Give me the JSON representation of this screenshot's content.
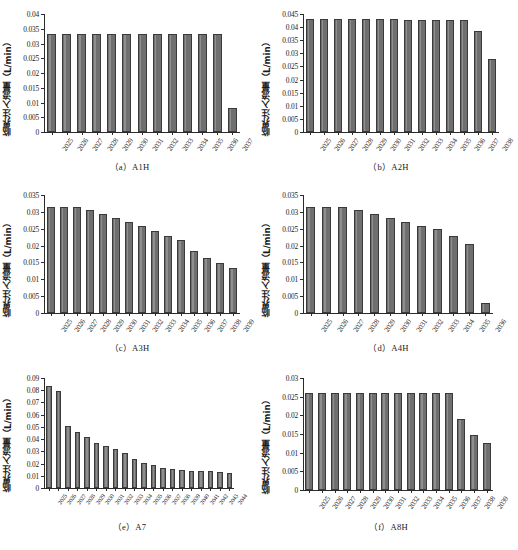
{
  "figure": {
    "y_axis_label": "临界注入流量（L/min）",
    "units": "L/min"
  },
  "chart_data": [
    {
      "type": "bar",
      "panel": "a",
      "title": "（a）A1H",
      "xlabel": "",
      "ylabel": "临界注入流量（L/min）",
      "ylim": [
        0,
        0.04
      ],
      "yticks": [
        0,
        0.005,
        0.01,
        0.015,
        0.02,
        0.025,
        0.03,
        0.035,
        0.04
      ],
      "ytick_labels": [
        "0",
        "0.005",
        "0.01",
        "0.015",
        "0.02",
        "0.025",
        "0.03",
        "0.035",
        "0.04"
      ],
      "grid": false,
      "legend": "none",
      "categories": [
        "2025",
        "2026",
        "2027",
        "2028",
        "2029",
        "2030",
        "2031",
        "2032",
        "2033",
        "2034",
        "2035",
        "2036",
        "2037"
      ],
      "values": [
        0.0332,
        0.0332,
        0.0332,
        0.0332,
        0.0332,
        0.0332,
        0.0332,
        0.0332,
        0.0332,
        0.0332,
        0.0332,
        0.0331,
        0.008
      ]
    },
    {
      "type": "bar",
      "panel": "b",
      "title": "（b）A2H",
      "xlabel": "",
      "ylabel": "临界注入流量（L/min）",
      "ylim": [
        0,
        0.045
      ],
      "yticks": [
        0,
        0.005,
        0.01,
        0.015,
        0.02,
        0.025,
        0.03,
        0.035,
        0.04,
        0.045
      ],
      "ytick_labels": [
        "0",
        "0.005",
        "0.01",
        "0.015",
        "0.02",
        "0.025",
        "0.03",
        "0.035",
        "0.04",
        "0.045"
      ],
      "grid": false,
      "legend": "none",
      "categories": [
        "2025",
        "2026",
        "2027",
        "2028",
        "2029",
        "2030",
        "2031",
        "2032",
        "2033",
        "2034",
        "2035",
        "2036",
        "2037",
        "2038"
      ],
      "values": [
        0.043,
        0.043,
        0.043,
        0.043,
        0.043,
        0.043,
        0.043,
        0.0429,
        0.0429,
        0.0429,
        0.0429,
        0.0428,
        0.0385,
        0.0278
      ]
    },
    {
      "type": "bar",
      "panel": "c",
      "title": "（c）A3H",
      "xlabel": "",
      "ylabel": "临界注入流量（L/min）",
      "ylim": [
        0,
        0.035
      ],
      "yticks": [
        0,
        0.005,
        0.01,
        0.015,
        0.02,
        0.025,
        0.03,
        0.035
      ],
      "ytick_labels": [
        "0",
        "0.005",
        "0.01",
        "0.015",
        "0.02",
        "0.025",
        "0.03",
        "0.035"
      ],
      "grid": false,
      "legend": "none",
      "categories": [
        "2025",
        "2026",
        "2027",
        "2028",
        "2029",
        "2030",
        "2031",
        "2032",
        "2033",
        "2034",
        "2035",
        "2036",
        "2037",
        "2038",
        "2039"
      ],
      "values": [
        0.0315,
        0.0315,
        0.0315,
        0.0305,
        0.0293,
        0.0281,
        0.027,
        0.0257,
        0.0243,
        0.0228,
        0.0218,
        0.0183,
        0.0163,
        0.0147,
        0.0135
      ]
    },
    {
      "type": "bar",
      "panel": "d",
      "title": "（d）A4H",
      "xlabel": "",
      "ylabel": "临界注入流量（L/min）",
      "ylim": [
        0,
        0.035
      ],
      "yticks": [
        0,
        0.005,
        0.01,
        0.015,
        0.02,
        0.025,
        0.03,
        0.035
      ],
      "ytick_labels": [
        "0",
        "0.005",
        "0.01",
        "0.015",
        "0.02",
        "0.025",
        "0.03",
        "0.035"
      ],
      "grid": false,
      "legend": "none",
      "categories": [
        "2025",
        "2026",
        "2027",
        "2028",
        "2029",
        "2030",
        "2031",
        "2032",
        "2033",
        "2034",
        "2035",
        "2036"
      ],
      "values": [
        0.0315,
        0.0315,
        0.0315,
        0.0306,
        0.0294,
        0.0281,
        0.027,
        0.0257,
        0.0249,
        0.0228,
        0.0205,
        0.0029
      ]
    },
    {
      "type": "bar",
      "panel": "e",
      "title": "（e）A7",
      "xlabel": "",
      "ylabel": "临界注入流量（L/min）",
      "ylim": [
        0,
        0.09
      ],
      "yticks": [
        0,
        0.01,
        0.02,
        0.03,
        0.04,
        0.05,
        0.06,
        0.07,
        0.08,
        0.09
      ],
      "ytick_labels": [
        "0",
        "0.01",
        "0.02",
        "0.03",
        "0.04",
        "0.05",
        "0.06",
        "0.07",
        "0.08",
        "0.09"
      ],
      "grid": false,
      "legend": "none",
      "categories": [
        "2025",
        "2026",
        "2027",
        "2028",
        "2029",
        "2030",
        "2031",
        "2032",
        "2033",
        "2034",
        "2035",
        "2036",
        "2037",
        "2038",
        "2039",
        "2040",
        "2041",
        "2042",
        "2043",
        "2044"
      ],
      "values": [
        0.0832,
        0.079,
        0.0505,
        0.0462,
        0.0418,
        0.037,
        0.0345,
        0.0322,
        0.0288,
        0.0236,
        0.0201,
        0.0191,
        0.0167,
        0.0156,
        0.0148,
        0.0141,
        0.0138,
        0.0136,
        0.0135,
        0.0122
      ]
    },
    {
      "type": "bar",
      "panel": "f",
      "title": "（f）A8H",
      "xlabel": "",
      "ylabel": "临界注入流量（L/min）",
      "ylim": [
        0,
        0.03
      ],
      "yticks": [
        0,
        0.005,
        0.01,
        0.015,
        0.02,
        0.025,
        0.03
      ],
      "ytick_labels": [
        "0",
        "0.005",
        "0.01",
        "0.015",
        "0.02",
        "0.025",
        "0.03"
      ],
      "grid": false,
      "legend": "none",
      "categories": [
        "2025",
        "2026",
        "2027",
        "2028",
        "2029",
        "2030",
        "2031",
        "2032",
        "2033",
        "2034",
        "2035",
        "2036",
        "2037",
        "2038",
        "2039"
      ],
      "values": [
        0.0261,
        0.0261,
        0.0261,
        0.0261,
        0.0261,
        0.0261,
        0.0261,
        0.0261,
        0.0261,
        0.0261,
        0.0261,
        0.0261,
        0.0191,
        0.0148,
        0.0125
      ]
    }
  ],
  "style": {
    "bar_fill": "#6f6f6f",
    "bar_edge": "#3a3a3a",
    "axis_color": "#2b2b2b",
    "background": "#ffffff"
  }
}
